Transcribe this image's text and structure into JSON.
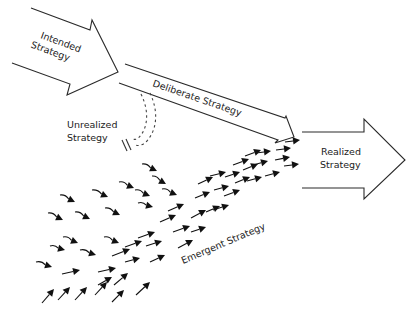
{
  "diagram": {
    "type": "strategy-flow",
    "labels": {
      "intended": [
        "Intended",
        "Strategy"
      ],
      "deliberate": "Deliberate Strategy",
      "unrealized": [
        "Unrealized",
        "Strategy"
      ],
      "realized": [
        "Realized",
        "Strategy"
      ],
      "emergent": "Emergent Strategy"
    },
    "colors": {
      "background": "#ffffff",
      "outline": "#2a2a2a",
      "arrow_fill": "#111111",
      "text": "#222222"
    },
    "emergent_arrows": [
      {
        "x1": 60,
        "y1": 195,
        "x2": 75,
        "y2": 202,
        "c": 1
      },
      {
        "x1": 92,
        "y1": 190,
        "x2": 108,
        "y2": 197,
        "c": 1
      },
      {
        "x1": 119,
        "y1": 182,
        "x2": 134,
        "y2": 188,
        "c": 1
      },
      {
        "x1": 48,
        "y1": 213,
        "x2": 63,
        "y2": 220,
        "c": 1
      },
      {
        "x1": 75,
        "y1": 212,
        "x2": 90,
        "y2": 219,
        "c": 1
      },
      {
        "x1": 105,
        "y1": 208,
        "x2": 120,
        "y2": 215,
        "c": 1
      },
      {
        "x1": 135,
        "y1": 190,
        "x2": 150,
        "y2": 196,
        "c": 1
      },
      {
        "x1": 138,
        "y1": 203,
        "x2": 153,
        "y2": 207,
        "c": 1
      },
      {
        "x1": 152,
        "y1": 176,
        "x2": 166,
        "y2": 184,
        "c": 1
      },
      {
        "x1": 142,
        "y1": 164,
        "x2": 157,
        "y2": 171,
        "c": 1
      },
      {
        "x1": 162,
        "y1": 189,
        "x2": 177,
        "y2": 195,
        "c": 1
      },
      {
        "x1": 63,
        "y1": 237,
        "x2": 78,
        "y2": 243,
        "c": 1
      },
      {
        "x1": 50,
        "y1": 246,
        "x2": 65,
        "y2": 250,
        "c": 1
      },
      {
        "x1": 80,
        "y1": 250,
        "x2": 96,
        "y2": 255,
        "c": 1
      },
      {
        "x1": 104,
        "y1": 237,
        "x2": 119,
        "y2": 243,
        "c": 1
      },
      {
        "x1": 36,
        "y1": 262,
        "x2": 52,
        "y2": 267,
        "c": 1
      },
      {
        "x1": 62,
        "y1": 274,
        "x2": 80,
        "y2": 270,
        "c": 0
      },
      {
        "x1": 98,
        "y1": 272,
        "x2": 116,
        "y2": 268,
        "c": 0
      },
      {
        "x1": 112,
        "y1": 256,
        "x2": 130,
        "y2": 249,
        "c": 0
      },
      {
        "x1": 125,
        "y1": 247,
        "x2": 142,
        "y2": 241,
        "c": 0
      },
      {
        "x1": 138,
        "y1": 238,
        "x2": 155,
        "y2": 232,
        "c": 0
      },
      {
        "x1": 160,
        "y1": 222,
        "x2": 176,
        "y2": 215,
        "c": 0
      },
      {
        "x1": 168,
        "y1": 211,
        "x2": 184,
        "y2": 204,
        "c": 0
      },
      {
        "x1": 173,
        "y1": 232,
        "x2": 190,
        "y2": 226,
        "c": 0
      },
      {
        "x1": 178,
        "y1": 248,
        "x2": 193,
        "y2": 240,
        "c": 0
      },
      {
        "x1": 191,
        "y1": 232,
        "x2": 206,
        "y2": 227,
        "c": 0
      },
      {
        "x1": 191,
        "y1": 218,
        "x2": 206,
        "y2": 210,
        "c": 0
      },
      {
        "x1": 195,
        "y1": 198,
        "x2": 210,
        "y2": 192,
        "c": 0
      },
      {
        "x1": 206,
        "y1": 212,
        "x2": 220,
        "y2": 206,
        "c": 0
      },
      {
        "x1": 198,
        "y1": 184,
        "x2": 213,
        "y2": 177,
        "c": 0
      },
      {
        "x1": 210,
        "y1": 176,
        "x2": 226,
        "y2": 172,
        "c": 0
      },
      {
        "x1": 214,
        "y1": 190,
        "x2": 229,
        "y2": 186,
        "c": 0
      },
      {
        "x1": 225,
        "y1": 177,
        "x2": 240,
        "y2": 172,
        "c": 0
      },
      {
        "x1": 224,
        "y1": 196,
        "x2": 240,
        "y2": 190,
        "c": 0
      },
      {
        "x1": 213,
        "y1": 210,
        "x2": 229,
        "y2": 205,
        "c": 0
      },
      {
        "x1": 235,
        "y1": 183,
        "x2": 250,
        "y2": 177,
        "c": 0
      },
      {
        "x1": 233,
        "y1": 165,
        "x2": 249,
        "y2": 159,
        "c": 0
      },
      {
        "x1": 243,
        "y1": 170,
        "x2": 258,
        "y2": 164,
        "c": 0
      },
      {
        "x1": 247,
        "y1": 181,
        "x2": 262,
        "y2": 177,
        "c": 0
      },
      {
        "x1": 245,
        "y1": 156,
        "x2": 261,
        "y2": 150,
        "c": 0
      },
      {
        "x1": 253,
        "y1": 165,
        "x2": 268,
        "y2": 161,
        "c": 0
      },
      {
        "x1": 256,
        "y1": 153,
        "x2": 271,
        "y2": 151,
        "c": 0
      },
      {
        "x1": 265,
        "y1": 176,
        "x2": 280,
        "y2": 172,
        "c": 0
      },
      {
        "x1": 275,
        "y1": 160,
        "x2": 290,
        "y2": 157,
        "c": 0
      },
      {
        "x1": 276,
        "y1": 150,
        "x2": 291,
        "y2": 148,
        "c": 0
      },
      {
        "x1": 284,
        "y1": 166,
        "x2": 299,
        "y2": 164,
        "c": 0
      },
      {
        "x1": 285,
        "y1": 142,
        "x2": 300,
        "y2": 140,
        "c": 0
      },
      {
        "x1": 42,
        "y1": 303,
        "x2": 54,
        "y2": 289,
        "c": 0
      },
      {
        "x1": 58,
        "y1": 300,
        "x2": 70,
        "y2": 287,
        "c": 0
      },
      {
        "x1": 75,
        "y1": 300,
        "x2": 87,
        "y2": 287,
        "c": 0
      },
      {
        "x1": 95,
        "y1": 295,
        "x2": 107,
        "y2": 282,
        "c": 0
      },
      {
        "x1": 112,
        "y1": 302,
        "x2": 124,
        "y2": 290,
        "c": 0
      },
      {
        "x1": 114,
        "y1": 285,
        "x2": 128,
        "y2": 273,
        "c": 0
      },
      {
        "x1": 136,
        "y1": 295,
        "x2": 150,
        "y2": 282,
        "c": 0
      },
      {
        "x1": 98,
        "y1": 285,
        "x2": 112,
        "y2": 277,
        "c": 0
      },
      {
        "x1": 125,
        "y1": 262,
        "x2": 140,
        "y2": 258,
        "c": 0
      },
      {
        "x1": 146,
        "y1": 246,
        "x2": 162,
        "y2": 241,
        "c": 0
      },
      {
        "x1": 150,
        "y1": 262,
        "x2": 165,
        "y2": 255,
        "c": 0
      }
    ]
  }
}
